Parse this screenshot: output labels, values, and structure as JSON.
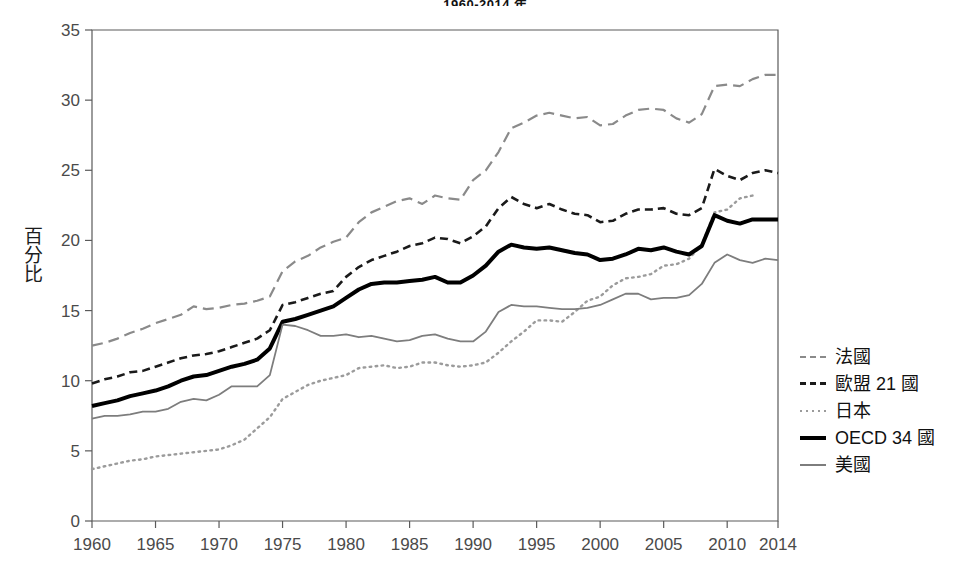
{
  "chart_data": {
    "type": "line",
    "title": "1960-2014 年",
    "xlabel": "",
    "ylabel": "百分比",
    "xlim": [
      1960,
      2014
    ],
    "ylim": [
      0,
      35
    ],
    "grid": false,
    "legend_position": "right",
    "x_ticks": [
      "1960",
      "1965",
      "1970",
      "1975",
      "1980",
      "1985",
      "1990",
      "1995",
      "2000",
      "2005",
      "2010",
      "2014"
    ],
    "x_tick_values": [
      1960,
      1965,
      1970,
      1975,
      1980,
      1985,
      1990,
      1995,
      2000,
      2005,
      2010,
      2014
    ],
    "y_ticks": [
      "0",
      "5",
      "10",
      "15",
      "20",
      "25",
      "30",
      "35"
    ],
    "y_tick_values": [
      0,
      5,
      10,
      15,
      20,
      25,
      30,
      35
    ],
    "x": [
      1960,
      1961,
      1962,
      1963,
      1964,
      1965,
      1966,
      1967,
      1968,
      1969,
      1970,
      1971,
      1972,
      1973,
      1974,
      1975,
      1976,
      1977,
      1978,
      1979,
      1980,
      1981,
      1982,
      1983,
      1984,
      1985,
      1986,
      1987,
      1988,
      1989,
      1990,
      1991,
      1992,
      1993,
      1994,
      1995,
      1996,
      1997,
      1998,
      1999,
      2000,
      2001,
      2002,
      2003,
      2004,
      2005,
      2006,
      2007,
      2008,
      2009,
      2010,
      2011,
      2012,
      2013,
      2014
    ],
    "series": [
      {
        "name": "法國",
        "style": "dashed",
        "color": "#8a8a8a",
        "width": 2.2,
        "dash": "11,6",
        "values": [
          12.5,
          12.7,
          13.0,
          13.4,
          13.7,
          14.1,
          14.4,
          14.7,
          15.3,
          15.1,
          15.2,
          15.4,
          15.5,
          15.7,
          16.0,
          17.8,
          18.5,
          18.9,
          19.5,
          19.9,
          20.2,
          21.3,
          22.0,
          22.4,
          22.8,
          23.0,
          22.6,
          23.2,
          23.0,
          22.9,
          24.3,
          25.0,
          26.3,
          28.0,
          28.4,
          28.9,
          29.1,
          28.9,
          28.7,
          28.8,
          28.2,
          28.3,
          28.9,
          29.3,
          29.4,
          29.3,
          28.7,
          28.4,
          29.0,
          31.0,
          31.1,
          31.0,
          31.5,
          31.8,
          31.8
        ]
      },
      {
        "name": "歐盟 21 國",
        "style": "dashed",
        "color": "#1a1a1a",
        "width": 2.6,
        "dash": "8,5",
        "values": [
          9.8,
          10.1,
          10.3,
          10.6,
          10.7,
          11.0,
          11.3,
          11.6,
          11.8,
          11.9,
          12.1,
          12.4,
          12.7,
          13.0,
          13.6,
          15.4,
          15.6,
          15.9,
          16.2,
          16.4,
          17.4,
          18.1,
          18.6,
          18.9,
          19.2,
          19.6,
          19.8,
          20.2,
          20.1,
          19.8,
          20.3,
          21.0,
          22.3,
          23.1,
          22.6,
          22.3,
          22.6,
          22.2,
          21.9,
          21.8,
          21.3,
          21.4,
          21.9,
          22.2,
          22.2,
          22.3,
          21.9,
          21.8,
          22.3,
          25.1,
          24.6,
          24.3,
          24.8,
          25.0,
          24.8
        ]
      },
      {
        "name": "日本",
        "style": "dotted",
        "color": "#9b9b9b",
        "width": 2.4,
        "dash": "1.6,4.4",
        "values": [
          3.7,
          3.9,
          4.1,
          4.3,
          4.4,
          4.6,
          4.7,
          4.8,
          4.9,
          5.0,
          5.1,
          5.4,
          5.8,
          6.6,
          7.4,
          8.7,
          9.2,
          9.7,
          10.0,
          10.2,
          10.4,
          10.9,
          11.0,
          11.1,
          10.9,
          11.0,
          11.3,
          11.3,
          11.1,
          11.0,
          11.1,
          11.3,
          12.0,
          12.8,
          13.5,
          14.3,
          14.3,
          14.2,
          14.9,
          15.7,
          16.0,
          16.8,
          17.3,
          17.4,
          17.6,
          18.2,
          18.3,
          18.7,
          19.7,
          22.0,
          22.2,
          23.0,
          23.2,
          null,
          null
        ]
      },
      {
        "name": "OECD 34 國",
        "style": "solid",
        "color": "#000000",
        "width": 4.0,
        "dash": "",
        "values": [
          8.2,
          8.4,
          8.6,
          8.9,
          9.1,
          9.3,
          9.6,
          10.0,
          10.3,
          10.4,
          10.7,
          11.0,
          11.2,
          11.5,
          12.3,
          14.2,
          14.4,
          14.7,
          15.0,
          15.3,
          15.9,
          16.5,
          16.9,
          17.0,
          17.0,
          17.1,
          17.2,
          17.4,
          17.0,
          17.0,
          17.5,
          18.2,
          19.2,
          19.7,
          19.5,
          19.4,
          19.5,
          19.3,
          19.1,
          19.0,
          18.6,
          18.7,
          19.0,
          19.4,
          19.3,
          19.5,
          19.2,
          19.0,
          19.6,
          21.8,
          21.4,
          21.2,
          21.5,
          21.5,
          21.5
        ]
      },
      {
        "name": "美國",
        "style": "solid",
        "color": "#7d7d7d",
        "width": 1.8,
        "dash": "",
        "values": [
          7.3,
          7.5,
          7.5,
          7.6,
          7.8,
          7.8,
          8.0,
          8.5,
          8.7,
          8.6,
          9.0,
          9.6,
          9.6,
          9.6,
          10.4,
          14.0,
          13.9,
          13.6,
          13.2,
          13.2,
          13.3,
          13.1,
          13.2,
          13.0,
          12.8,
          12.9,
          13.2,
          13.3,
          13.0,
          12.8,
          12.8,
          13.5,
          14.9,
          15.4,
          15.3,
          15.3,
          15.2,
          15.1,
          15.1,
          15.2,
          15.4,
          15.8,
          16.2,
          16.2,
          15.8,
          15.9,
          15.9,
          16.1,
          16.9,
          18.4,
          19.0,
          18.6,
          18.4,
          18.7,
          18.6
        ]
      }
    ]
  }
}
